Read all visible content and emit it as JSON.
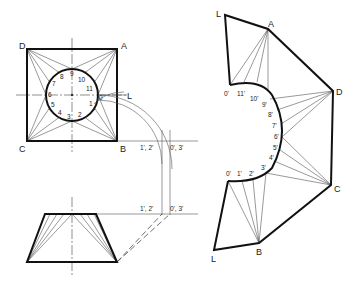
{
  "plan": {
    "corners": {
      "A": "A",
      "B": "B",
      "C": "C",
      "D": "D"
    },
    "circle_points": [
      "0",
      "1",
      "2",
      "3",
      "4",
      "5",
      "6",
      "7",
      "8",
      "9",
      "10",
      "11"
    ],
    "seam_label": "L"
  },
  "projection_labels": {
    "plan_left": "1', 2'",
    "plan_right": "0', 3'",
    "elev_left": "1', 2'",
    "elev_right": "0', 3'"
  },
  "development": {
    "corners": {
      "A": "A",
      "B": "B",
      "C": "C",
      "D": "D"
    },
    "seam_top": "L",
    "seam_bottom": "L",
    "arc_points": [
      "0'",
      "11'",
      "10'",
      "9'",
      "8'",
      "7'",
      "6'",
      "5'",
      "4'",
      "3'",
      "2'",
      "1'",
      "0'"
    ]
  },
  "colors": {
    "line": "#111111",
    "background": "#ffffff"
  }
}
